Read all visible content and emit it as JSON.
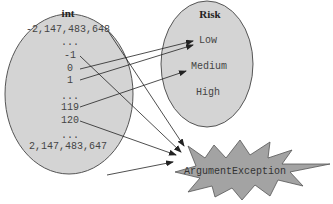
{
  "colors": {
    "ellipse_fill": "#d4d4d4",
    "ellipse_stroke": "#555555",
    "star_fill": "#a3a3a3",
    "star_stroke": "#555555",
    "arrow": "#222222"
  },
  "domain_set": {
    "title": "int",
    "values": [
      "-2,147,483,648",
      "...",
      "-1",
      "0",
      "1",
      "...",
      "119",
      "120",
      "...",
      "2,147,483,647"
    ]
  },
  "codomain_set": {
    "title": "Risk",
    "values": [
      "Low",
      "Medium",
      "High"
    ]
  },
  "exception": {
    "label": "ArgumentException"
  },
  "mappings": [
    {
      "from": "-2,147,483,648",
      "to": "ArgumentException"
    },
    {
      "from": "-1",
      "to": "ArgumentException"
    },
    {
      "from": "0",
      "to": "Low"
    },
    {
      "from": "1",
      "to": "Low"
    },
    {
      "from": "119",
      "to": "Medium"
    },
    {
      "from": "120",
      "to": "ArgumentException"
    },
    {
      "from": "2,147,483,647",
      "to": "ArgumentException"
    }
  ]
}
